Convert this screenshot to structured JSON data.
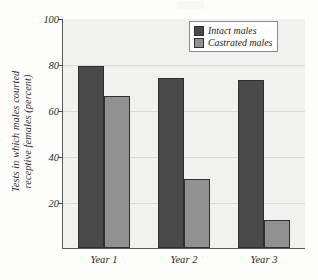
{
  "chart_data": {
    "type": "bar",
    "title": "",
    "xlabel": "",
    "ylabel": {
      "line1": "Tests in which males courted",
      "line2": "receptive females (percent)",
      "full": "Tests in which males courted receptive females (percent)"
    },
    "categories": [
      "Year 1",
      "Year 2",
      "Year 3"
    ],
    "series": [
      {
        "name": "Intact males",
        "color": "#4a4a4a",
        "values": [
          79,
          74,
          73
        ]
      },
      {
        "name": "Castrated males",
        "color": "#919191",
        "values": [
          66,
          30,
          12
        ]
      }
    ],
    "ylim": [
      0,
      100
    ],
    "yticks": [
      20,
      40,
      60,
      80,
      100
    ],
    "ytick_labels": [
      "20",
      "40",
      "60",
      "80",
      "100"
    ],
    "grid": true,
    "legend_position": "top-right"
  },
  "legend": {
    "items": [
      {
        "label": "Intact males",
        "swatch": "dark-gray-swatch"
      },
      {
        "label": "Castrated males",
        "swatch": "light-gray-swatch"
      }
    ]
  },
  "colors": {
    "intact": "#4a4a4a",
    "castrated": "#919191",
    "plot_background": "#f1f1ef",
    "page_background": "#fdfdfc",
    "axis": "#5a5a5a",
    "gridline": "#d9d9d6",
    "text": "#2b2b2b"
  }
}
